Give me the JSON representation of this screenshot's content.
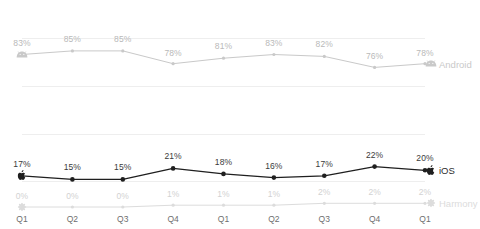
{
  "chart_data": {
    "type": "line",
    "title": "",
    "subtitle": "",
    "xlabel": "",
    "ylabel": "",
    "ylim": [
      0,
      92
    ],
    "grid": true,
    "legend_position": "end-of-line",
    "categories": [
      "Q1",
      "Q2",
      "Q3",
      "Q4",
      "Q1",
      "Q2",
      "Q3",
      "Q4",
      "Q1"
    ],
    "value_suffix": "%",
    "series": [
      {
        "name": "Android",
        "icon": "android-robot-icon",
        "color": "#c9c9c9",
        "values": [
          83,
          85,
          85,
          78,
          81,
          83,
          82,
          76,
          78
        ],
        "labels": [
          "83%",
          "85%",
          "85%",
          "78%",
          "81%",
          "83%",
          "82%",
          "76%",
          "78%"
        ]
      },
      {
        "name": "iOS",
        "icon": "apple-logo-icon",
        "color": "#1f1f1f",
        "values": [
          17,
          15,
          15,
          21,
          18,
          16,
          17,
          22,
          20
        ],
        "labels": [
          "17%",
          "15%",
          "15%",
          "21%",
          "18%",
          "16%",
          "17%",
          "22%",
          "20%"
        ]
      },
      {
        "name": "Harmony",
        "icon": "harmony-flower-icon",
        "color": "#dcdcdc",
        "values": [
          0,
          0,
          0,
          1,
          1,
          1,
          2,
          2,
          2
        ],
        "labels": [
          "0%",
          "0%",
          "0%",
          "1%",
          "1%",
          "1%",
          "2%",
          "2%",
          "2%"
        ]
      }
    ],
    "gridlines": [
      14,
      40,
      66,
      92,
      118,
      144,
      170,
      196
    ],
    "colors": {
      "grid": "#eeeeee",
      "background": "#ffffff",
      "category_text": "#6e6e6e"
    }
  }
}
